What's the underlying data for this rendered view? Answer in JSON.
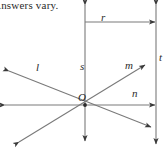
{
  "caption": {
    "text": "Answers vary."
  },
  "figure": {
    "type": "geometry-diagram",
    "stroke_color": "#6e6e6e",
    "arrow_color": "#3a3a3a",
    "text_color": "#2b2b2b",
    "origin": {
      "label": "O",
      "x": 85,
      "y": 105
    },
    "elements": [
      {
        "name": "line-s",
        "label": "s",
        "kind": "line",
        "orientation": "vertical",
        "x1": 85,
        "y1": 4,
        "x2": 85,
        "y2": 142,
        "arrows": "both"
      },
      {
        "name": "ray-r",
        "label": "r",
        "kind": "ray",
        "orientation": "horizontal",
        "x1": 85,
        "y1": 22,
        "x2": 156,
        "y2": 22,
        "arrows": "end"
      },
      {
        "name": "line-n",
        "label": "n",
        "kind": "line",
        "orientation": "horizontal",
        "x1": 4,
        "y1": 105,
        "x2": 156,
        "y2": 105,
        "arrows": "both"
      },
      {
        "name": "line-l",
        "label": "l",
        "kind": "line",
        "orientation": "diagonal-up-left",
        "x1": 8,
        "y1": 70,
        "x2": 152,
        "y2": 128,
        "arrows": "both"
      },
      {
        "name": "line-m",
        "label": "m",
        "kind": "line",
        "orientation": "diagonal-up-right",
        "x1": 18,
        "y1": 143,
        "x2": 146,
        "y2": 64,
        "arrows": "both"
      },
      {
        "name": "line-t",
        "label": "t",
        "kind": "line",
        "orientation": "vertical",
        "x1": 156,
        "y1": 3,
        "x2": 156,
        "y2": 145,
        "arrows": "both"
      }
    ],
    "labels": [
      {
        "name": "label-r",
        "text": "r"
      },
      {
        "name": "label-s",
        "text": "s"
      },
      {
        "name": "label-l",
        "text": "l"
      },
      {
        "name": "label-m",
        "text": "m"
      },
      {
        "name": "label-n",
        "text": "n"
      },
      {
        "name": "label-t",
        "text": "t"
      },
      {
        "name": "label-origin",
        "text": "O"
      }
    ]
  }
}
